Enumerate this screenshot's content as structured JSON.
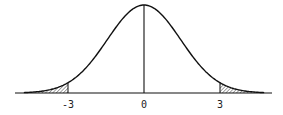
{
  "diagram": {
    "type": "normal-distribution-curve",
    "x_ticks": [
      {
        "value": -3,
        "label": "-3"
      },
      {
        "value": 0,
        "label": "0"
      },
      {
        "value": 3,
        "label": "3"
      }
    ],
    "center_line": 0,
    "shaded_regions": [
      {
        "from": "-inf",
        "to": -3,
        "label": "left-tail"
      },
      {
        "from": 3,
        "to": "inf",
        "label": "right-tail"
      }
    ],
    "colors": {
      "line": "#111111",
      "hatch": "#333333",
      "background": "#ffffff"
    }
  }
}
